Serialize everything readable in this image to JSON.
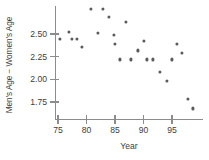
{
  "chart_data": {
    "type": "scatter",
    "title": "",
    "xlabel": "Year",
    "ylabel": "Men's Age − Women's Age",
    "xlim": [
      73.5,
      99.8
    ],
    "ylim": [
      1.62,
      2.85
    ],
    "grid": false,
    "legend": null,
    "xticks": [
      75,
      80,
      85,
      90,
      95
    ],
    "xtick_labels": [
      "75",
      "80",
      "85",
      "90",
      "95"
    ],
    "yticks": [
      2.5,
      2.25,
      2.0,
      1.75
    ],
    "ytick_labels": [
      "2.50",
      "2.25",
      "2.00",
      "1.75"
    ],
    "marker_color": "#5b5b5b",
    "axis_color": "#8c8c8c",
    "x": [
      75.4,
      76.9,
      77.5,
      78.3,
      79.2,
      80.8,
      82.0,
      82.9,
      83.9,
      84.8,
      85.0,
      85.9,
      86.9,
      87.8,
      89.0,
      90.1,
      90.6,
      91.6,
      92.9,
      94.1,
      95.0,
      95.9,
      96.8,
      97.8,
      98.7
    ],
    "y": [
      2.45,
      2.52,
      2.45,
      2.45,
      2.36,
      2.78,
      2.51,
      2.78,
      2.69,
      2.49,
      2.39,
      2.22,
      2.63,
      2.22,
      2.32,
      2.42,
      2.22,
      2.22,
      2.08,
      1.98,
      2.22,
      2.39,
      2.29,
      1.78,
      1.68
    ],
    "points": [
      {
        "year": 75.4,
        "value": 2.45
      },
      {
        "year": 76.9,
        "value": 2.52
      },
      {
        "year": 77.5,
        "value": 2.45
      },
      {
        "year": 78.3,
        "value": 2.45
      },
      {
        "year": 79.2,
        "value": 2.36
      },
      {
        "year": 80.8,
        "value": 2.78
      },
      {
        "year": 82.0,
        "value": 2.51
      },
      {
        "year": 82.9,
        "value": 2.78
      },
      {
        "year": 83.9,
        "value": 2.69
      },
      {
        "year": 84.8,
        "value": 2.49
      },
      {
        "year": 85.0,
        "value": 2.39
      },
      {
        "year": 85.9,
        "value": 2.22
      },
      {
        "year": 86.9,
        "value": 2.63
      },
      {
        "year": 87.8,
        "value": 2.22
      },
      {
        "year": 89.0,
        "value": 2.32
      },
      {
        "year": 90.1,
        "value": 2.42
      },
      {
        "year": 90.6,
        "value": 2.22
      },
      {
        "year": 91.6,
        "value": 2.22
      },
      {
        "year": 92.9,
        "value": 2.08
      },
      {
        "year": 94.1,
        "value": 1.98
      },
      {
        "year": 95.0,
        "value": 2.22
      },
      {
        "year": 95.9,
        "value": 2.39
      },
      {
        "year": 96.8,
        "value": 2.29
      },
      {
        "year": 97.8,
        "value": 1.78
      },
      {
        "year": 98.7,
        "value": 1.68
      }
    ]
  }
}
